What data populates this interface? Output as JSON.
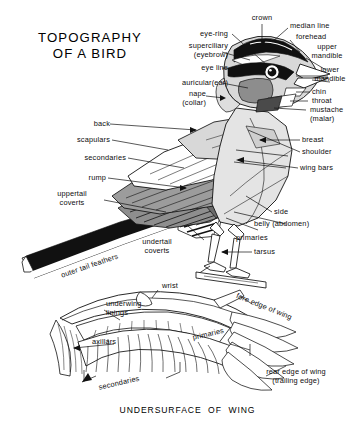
{
  "figure": {
    "title": "TOPOGRAPHY\nOF A BIRD",
    "caption": "UNDERSURFACE  OF  WING",
    "background_color": "#ffffff",
    "ink_color": "#0d0d0d"
  },
  "palette": {
    "black": "#111111",
    "dark_gray": "#6f6f6f",
    "mid_gray": "#a8a8a8",
    "light_gray": "#d2d2d2",
    "pale_gray": "#e8e8e8",
    "white": "#ffffff"
  },
  "labels": {
    "head": [
      {
        "id": "crown",
        "text": "crown"
      },
      {
        "id": "median-line",
        "text": "median line"
      },
      {
        "id": "forehead",
        "text": "forehead"
      },
      {
        "id": "upper-mandible",
        "text": "upper\nmandible"
      },
      {
        "id": "lower-mandible",
        "text": "lower\nmandible"
      },
      {
        "id": "eye-ring",
        "text": "eye-ring"
      },
      {
        "id": "superciliary",
        "text": "superciliary\n(eyebrow)"
      },
      {
        "id": "eye-line",
        "text": "eye line"
      },
      {
        "id": "auricular",
        "text": "auricular(ear)"
      },
      {
        "id": "nape",
        "text": "nape\n(collar)"
      },
      {
        "id": "chin",
        "text": "chin"
      },
      {
        "id": "throat",
        "text": "throat"
      },
      {
        "id": "mustache",
        "text": "mustache\n(malar)"
      }
    ],
    "body_right": [
      {
        "id": "breast",
        "text": "breast"
      },
      {
        "id": "shoulder",
        "text": "shoulder"
      },
      {
        "id": "wing-bars",
        "text": "wing bars"
      },
      {
        "id": "side",
        "text": "side"
      },
      {
        "id": "belly",
        "text": "belly (abdomen)"
      },
      {
        "id": "primaries-body",
        "text": "primaries"
      },
      {
        "id": "tarsus",
        "text": "tarsus"
      }
    ],
    "body_left": [
      {
        "id": "back",
        "text": "back"
      },
      {
        "id": "scapulars",
        "text": "scapulars"
      },
      {
        "id": "secondaries-body",
        "text": "secondaries"
      },
      {
        "id": "rump",
        "text": "rump"
      },
      {
        "id": "uppertail-coverts",
        "text": "uppertail\ncoverts"
      },
      {
        "id": "undertail-coverts",
        "text": "undertail\ncoverts"
      },
      {
        "id": "outer-tail-feathers",
        "text": "outer tail feathers"
      }
    ],
    "wing": [
      {
        "id": "wrist",
        "text": "wrist"
      },
      {
        "id": "underwing-linings",
        "text": "underwing\nlinings"
      },
      {
        "id": "axillars",
        "text": "axillars"
      },
      {
        "id": "fore-edge-of-wing",
        "text": "fore edge of wing"
      },
      {
        "id": "primaries-wing",
        "text": "primaries"
      },
      {
        "id": "secondaries-wing",
        "text": "secondaries"
      },
      {
        "id": "rear-edge-of-wing",
        "text": "rear edge of wing\n(trailing edge)"
      }
    ]
  }
}
